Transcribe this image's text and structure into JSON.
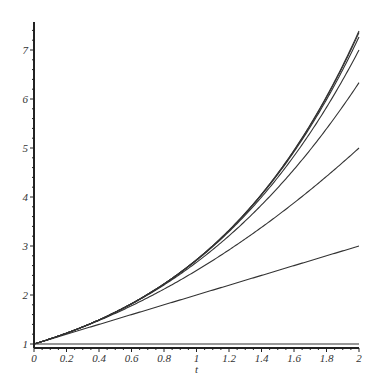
{
  "chart_data": {
    "type": "line",
    "title": "",
    "xlabel": "t",
    "ylabel": "",
    "xlim": [
      0,
      2
    ],
    "ylim": [
      0.9,
      7.6
    ],
    "grid": false,
    "legend": null,
    "x_ticks": [
      "0",
      "0.2",
      "0.4",
      "0.6",
      "0.8",
      "1",
      "1.2",
      "1.4",
      "1.6",
      "1.8",
      "2"
    ],
    "y_ticks": [
      "1",
      "2",
      "3",
      "4",
      "5",
      "6",
      "7"
    ],
    "series": [
      {
        "name": "degree 0: 1",
        "x": [
          0,
          2
        ],
        "values": [
          1,
          1
        ]
      },
      {
        "name": "degree 1: 1+t",
        "x": [
          0,
          2
        ],
        "values": [
          1,
          3
        ]
      },
      {
        "name": "degree 2",
        "x": [
          0,
          0.5,
          1,
          1.5,
          2
        ],
        "values": [
          1,
          1.625,
          2.5,
          3.625,
          5
        ]
      },
      {
        "name": "degree 3",
        "x": [
          0,
          0.5,
          1,
          1.5,
          2
        ],
        "values": [
          1,
          1.646,
          2.667,
          4.188,
          6.333
        ]
      },
      {
        "name": "degree 4",
        "x": [
          0,
          0.5,
          1,
          1.5,
          2
        ],
        "values": [
          1,
          1.648,
          2.708,
          4.398,
          7.0
        ]
      },
      {
        "name": "degree 5",
        "x": [
          0,
          0.5,
          1,
          1.5,
          2
        ],
        "values": [
          1,
          1.649,
          2.717,
          4.461,
          7.267
        ]
      },
      {
        "name": "degree 6",
        "x": [
          0,
          0.5,
          1,
          1.5,
          2
        ],
        "values": [
          1,
          1.649,
          2.718,
          4.477,
          7.356
        ]
      },
      {
        "name": "exp(t)",
        "x": [
          0,
          0.5,
          1,
          1.5,
          2
        ],
        "values": [
          1,
          1.649,
          2.718,
          4.482,
          7.389
        ]
      }
    ],
    "degrees": [
      0,
      1,
      2,
      3,
      4,
      5,
      6
    ],
    "include_exp": true,
    "line_color": "#333333"
  },
  "axes": {
    "x_label": "t"
  }
}
